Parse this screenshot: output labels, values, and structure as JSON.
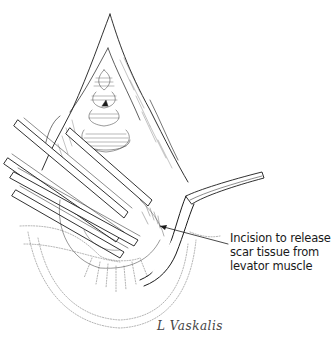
{
  "figure": {
    "callout": {
      "lines": [
        "Incision to release",
        "scar tissue from",
        "levator muscle"
      ],
      "arrow_target": "incision-site"
    },
    "signature": "L Vaskalis",
    "colors": {
      "line": "#1a1a1a",
      "background": "#ffffff",
      "hatch": "#555555"
    }
  }
}
